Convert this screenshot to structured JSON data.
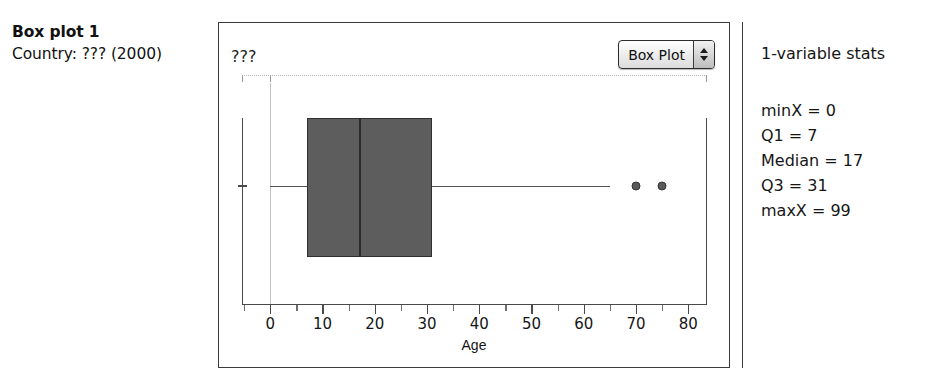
{
  "caption": {
    "title": "Box plot 1",
    "subtitle": "Country: ??? (2000)"
  },
  "plot": {
    "variable_label": "???",
    "plot_type_selector": {
      "selected": "Box Plot",
      "options": [
        "Box Plot",
        "Histogram",
        "Dot Plot",
        "Normal Plot"
      ]
    }
  },
  "stats": {
    "title": "1-variable stats",
    "rows": [
      {
        "text": "minX = 0"
      },
      {
        "text": "Q1 = 7"
      },
      {
        "text": "Median = 17"
      },
      {
        "text": "Q3 = 31"
      },
      {
        "text": "maxX = 99"
      }
    ]
  },
  "chart_data": {
    "type": "box",
    "title": "Box plot 1",
    "subtitle": "Country: ??? (2000)",
    "xlabel": "Age",
    "ylabel": "",
    "variable": "???",
    "xlim": [
      -5.4,
      83.6
    ],
    "xticks": [
      0,
      10,
      20,
      30,
      40,
      50,
      60,
      70,
      80
    ],
    "xtick_labels": [
      "0",
      "10",
      "20",
      "30",
      "40",
      "50",
      "60",
      "70",
      "80"
    ],
    "minor_tick_step": 5,
    "grid": false,
    "legend": "none",
    "series": [
      {
        "name": "???",
        "min": 0,
        "q1": 7,
        "median": 17,
        "q3": 31,
        "max": 99,
        "whisker_low": 0,
        "whisker_high": 65,
        "outliers": [
          70,
          75
        ],
        "box_fill": "#5d5d5d",
        "box_edge": "#2f2f2f",
        "median_color": "#2a2a2a",
        "whisker_color": "#555555",
        "outlier_color": "#5a5a5a"
      }
    ]
  },
  "colors": {
    "panel_border": "#3b3b3b",
    "axis": "#4a4a4a",
    "gridline": "#c2c2c2",
    "ruler_dotted": "#b5b5b5",
    "text": "#161616",
    "box_fill": "#5d5d5d"
  }
}
